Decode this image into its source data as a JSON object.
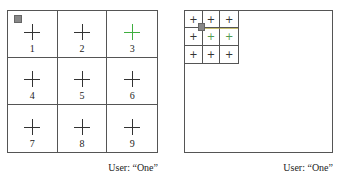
{
  "left_panel": {
    "cells": [
      {
        "label": "1",
        "cross_color": "#333333",
        "cursor": true
      },
      {
        "label": "2",
        "cross_color": "#333333"
      },
      {
        "label": "3",
        "cross_color": "#3fae3f"
      },
      {
        "label": "4",
        "cross_color": "#333333"
      },
      {
        "label": "5",
        "cross_color": "#333333"
      },
      {
        "label": "6",
        "cross_color": "#333333"
      },
      {
        "label": "7",
        "cross_color": "#333333"
      },
      {
        "label": "8",
        "cross_color": "#333333"
      },
      {
        "label": "9",
        "cross_color": "#333333"
      }
    ],
    "caption": "User: “One”"
  },
  "right_panel": {
    "cells": [
      {
        "symbol": "+",
        "color": "#333333"
      },
      {
        "symbol": "+",
        "color": "#333333"
      },
      {
        "symbol": "+",
        "color": "#333333"
      },
      {
        "symbol": "+",
        "color": "#333333"
      },
      {
        "symbol": "+",
        "color": "#4f9a4f"
      },
      {
        "symbol": "+",
        "color": "#4f9a4f"
      },
      {
        "symbol": "+",
        "color": "#333333"
      },
      {
        "symbol": "+",
        "color": "#333333"
      },
      {
        "symbol": "+",
        "color": "#333333"
      }
    ],
    "caption": "User: “One”"
  },
  "colors": {
    "highlight": "#3fae3f",
    "cursor": "#888888",
    "grid_line": "#555555"
  }
}
